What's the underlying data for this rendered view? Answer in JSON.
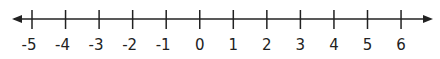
{
  "number_line": {
    "min": -5,
    "max": 6,
    "step": 1,
    "ticks": [
      -5,
      -4,
      -3,
      -2,
      -1,
      0,
      1,
      2,
      3,
      4,
      5,
      6
    ],
    "tick_labels": [
      "-5",
      "-4",
      "-3",
      "-2",
      "-1",
      "0",
      "1",
      "2",
      "3",
      "4",
      "5",
      "6"
    ],
    "arrows": "both",
    "line_color": "#222222"
  }
}
